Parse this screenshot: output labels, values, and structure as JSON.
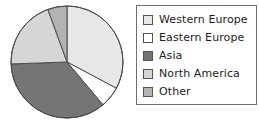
{
  "chart_data": {
    "type": "pie",
    "title": "",
    "subtitle": "",
    "xlabel": "",
    "ylabel": "",
    "grid": false,
    "legend_position": "right",
    "start_angle_deg": 0,
    "direction": "clockwise",
    "center": {
      "x": 67,
      "y": 62
    },
    "radius": 56,
    "labels": [
      "Western Europe",
      "Eastern Europe",
      "Asia",
      "North America",
      "Other"
    ],
    "values": [
      33,
      6,
      35,
      20,
      6
    ],
    "unit": "%",
    "colors": [
      "#e7e7e7",
      "#ffffff",
      "#757575",
      "#d6d6d6",
      "#b3b3b3"
    ],
    "slices": [
      {
        "label": "Western Europe",
        "value": 33,
        "color": "#e7e7e7",
        "start_deg": 0,
        "end_deg": 118
      },
      {
        "label": "Eastern Europe",
        "value": 6,
        "color": "#ffffff",
        "start_deg": 118,
        "end_deg": 140
      },
      {
        "label": "Asia",
        "value": 35,
        "color": "#757575",
        "start_deg": 140,
        "end_deg": 268
      },
      {
        "label": "North America",
        "value": 20,
        "color": "#d6d6d6",
        "start_deg": 268,
        "end_deg": 340
      },
      {
        "label": "Other",
        "value": 6,
        "color": "#b3b3b3",
        "start_deg": 340,
        "end_deg": 360
      }
    ],
    "annotations": [],
    "stroke_color": "#4d4d4d",
    "stroke_width": 1
  },
  "legend": {
    "border_color": "#6e6e6e",
    "background": "#ffffff",
    "items": [
      {
        "label": "Western Europe",
        "color": "#e7e7e7",
        "swatch_name": "legend-swatch-western-europe"
      },
      {
        "label": "Eastern Europe",
        "color": "#ffffff",
        "swatch_name": "legend-swatch-eastern-europe"
      },
      {
        "label": "Asia",
        "color": "#757575",
        "swatch_name": "legend-swatch-asia"
      },
      {
        "label": "North America",
        "color": "#d6d6d6",
        "swatch_name": "legend-swatch-north-america"
      },
      {
        "label": "Other",
        "color": "#b3b3b3",
        "swatch_name": "legend-swatch-other"
      }
    ]
  }
}
